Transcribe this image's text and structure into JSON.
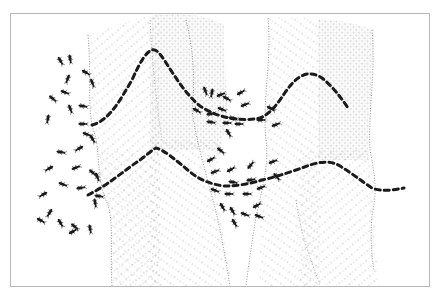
{
  "figure": {
    "ink_color": "#1a1a1a",
    "texture_color": "#8a8a8a",
    "frame_color": "#b8b8b8",
    "background": "#ffffff",
    "regions": [
      {
        "name": "left-structure",
        "texture": "diagonal-dots-and-stipple"
      },
      {
        "name": "right-structure",
        "texture": "diagonal-dots-and-stipple"
      }
    ],
    "trails": [
      {
        "name": "upper-trail",
        "style": "dashed-ants"
      },
      {
        "name": "lower-trail",
        "style": "dashed-ants"
      }
    ],
    "ant_clusters": [
      {
        "name": "left-cluster"
      },
      {
        "name": "middle-upper-cluster"
      },
      {
        "name": "middle-lower-cluster"
      }
    ]
  },
  "caption": {
    "text": ""
  }
}
